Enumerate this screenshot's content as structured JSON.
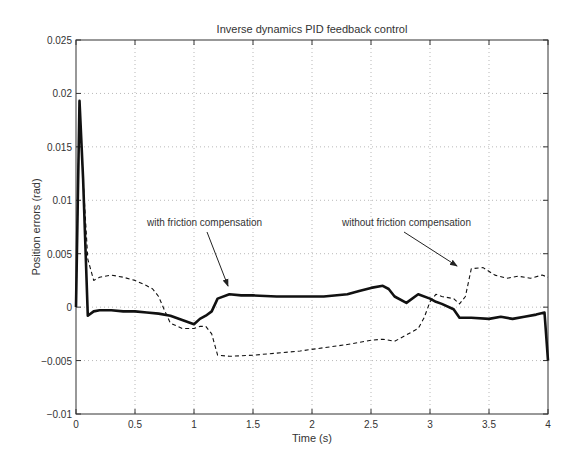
{
  "chart_data": {
    "type": "line",
    "title": "Inverse dynamics PID feedback control",
    "xlabel": "Time (s)",
    "ylabel": "Position errors (rad)",
    "xlim": [
      0,
      4
    ],
    "ylim": [
      -0.01,
      0.025
    ],
    "grid": true,
    "x_ticks": [
      0,
      0.5,
      1,
      1.5,
      2,
      2.5,
      3,
      3.5,
      4
    ],
    "x_tick_labels": [
      "0",
      "0.5",
      "1",
      "1.5",
      "2",
      "2.5",
      "3",
      "3.5",
      "4"
    ],
    "y_ticks": [
      -0.01,
      -0.005,
      0,
      0.005,
      0.01,
      0.015,
      0.02,
      0.025
    ],
    "y_tick_labels": [
      "-0.01",
      "-0.005",
      "0",
      "0.005",
      "0.01",
      "0.015",
      "0.02",
      "0.025"
    ],
    "series": [
      {
        "name": "with friction compensation",
        "style": "solid-thick",
        "x": [
          0,
          0.03,
          0.06,
          0.1,
          0.15,
          0.2,
          0.3,
          0.4,
          0.5,
          0.6,
          0.7,
          0.8,
          0.9,
          1.0,
          1.05,
          1.1,
          1.15,
          1.2,
          1.3,
          1.4,
          1.5,
          1.7,
          1.9,
          2.1,
          2.3,
          2.4,
          2.5,
          2.6,
          2.65,
          2.7,
          2.8,
          2.9,
          3.0,
          3.05,
          3.1,
          3.2,
          3.25,
          3.35,
          3.5,
          3.6,
          3.7,
          3.8,
          3.9,
          3.97,
          4.0
        ],
        "y": [
          0.0,
          0.0193,
          0.012,
          -0.0008,
          -0.0004,
          -0.0003,
          -0.0003,
          -0.0004,
          -0.0004,
          -0.0005,
          -0.0006,
          -0.0008,
          -0.0012,
          -0.0016,
          -0.0011,
          -0.0008,
          -0.0004,
          0.0008,
          0.0012,
          0.0011,
          0.0011,
          0.001,
          0.001,
          0.001,
          0.0012,
          0.0015,
          0.0018,
          0.002,
          0.0017,
          0.001,
          0.0004,
          0.0012,
          0.0008,
          0.0005,
          0.0003,
          -0.0002,
          -0.001,
          -0.001,
          -0.0011,
          -0.0009,
          -0.0011,
          -0.0009,
          -0.0007,
          -0.0005,
          -0.005
        ],
        "annotation": {
          "text": "with friction compensation",
          "points_to": [
            1.3,
            0.0013
          ]
        }
      },
      {
        "name": "without friction compensation",
        "style": "dashed",
        "x": [
          0,
          0.03,
          0.06,
          0.1,
          0.15,
          0.2,
          0.3,
          0.4,
          0.5,
          0.6,
          0.65,
          0.7,
          0.75,
          0.8,
          0.9,
          1.0,
          1.05,
          1.1,
          1.15,
          1.2,
          1.3,
          1.5,
          1.7,
          1.9,
          2.1,
          2.3,
          2.5,
          2.6,
          2.7,
          2.8,
          2.9,
          2.95,
          3.0,
          3.05,
          3.1,
          3.2,
          3.25,
          3.3,
          3.35,
          3.45,
          3.55,
          3.65,
          3.75,
          3.85,
          3.95,
          4.0
        ],
        "y": [
          0.0,
          0.0193,
          0.012,
          0.0045,
          0.0025,
          0.0028,
          0.003,
          0.0028,
          0.0025,
          0.002,
          0.0017,
          0.001,
          -0.0003,
          -0.0015,
          -0.002,
          -0.002,
          -0.0018,
          -0.0018,
          -0.0025,
          -0.0045,
          -0.0046,
          -0.0045,
          -0.0043,
          -0.0041,
          -0.0038,
          -0.0035,
          -0.0031,
          -0.003,
          -0.0032,
          -0.0026,
          -0.002,
          -0.001,
          0.0005,
          0.0012,
          0.001,
          0.0008,
          0.0003,
          0.001,
          0.0036,
          0.0037,
          0.003,
          0.0027,
          0.0029,
          0.0027,
          0.003,
          0.0028
        ],
        "annotation": {
          "text": "without friction compensation",
          "points_to": [
            3.25,
            0.0037
          ]
        }
      }
    ]
  }
}
